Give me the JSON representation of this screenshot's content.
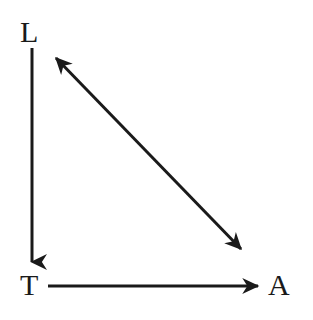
{
  "diagram": {
    "type": "node-arrow-diagram",
    "background_color": "#ffffff",
    "stroke_color": "#1a1a1a",
    "stroke_width": 3,
    "nodes": [
      {
        "id": "L",
        "label": "L",
        "position": "top-left",
        "x": 32,
        "y": 32
      },
      {
        "id": "T",
        "label": "T",
        "position": "bottom-left",
        "x": 32,
        "y": 285
      },
      {
        "id": "A",
        "label": "A",
        "position": "bottom-right",
        "x": 280,
        "y": 285
      }
    ],
    "edges": [
      {
        "id": "edge-L-T",
        "from": "L",
        "to": "T",
        "orientation": "vertical",
        "arrowheads": "end",
        "label": ""
      },
      {
        "id": "edge-T-A",
        "from": "T",
        "to": "A",
        "orientation": "horizontal",
        "arrowheads": "end",
        "label": ""
      },
      {
        "id": "edge-A-L",
        "from": "A",
        "to": "L",
        "orientation": "diagonal",
        "arrowheads": "both",
        "label": ""
      }
    ]
  }
}
